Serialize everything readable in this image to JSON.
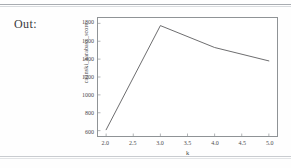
{
  "notebook": {
    "out_label": "Out:"
  },
  "chart_data": {
    "type": "line",
    "title": "",
    "xlabel": "k",
    "ylabel": "calinski_harabasz_score",
    "x": [
      2.0,
      3.0,
      4.0,
      5.0
    ],
    "values": [
      610,
      1775,
      1530,
      1380
    ],
    "series": [
      {
        "name": "calinski_harabasz_score",
        "values": [
          610,
          1775,
          1530,
          1380
        ],
        "color": "#5a5a5c"
      }
    ],
    "xlim": [
      1.85,
      5.15
    ],
    "ylim": [
      540,
      1860
    ],
    "xticks": [
      2.0,
      2.5,
      3.0,
      3.5,
      4.0,
      4.5,
      5.0
    ],
    "xtick_labels": [
      "2.0",
      "2.5",
      "3.0",
      "3.5",
      "4.0",
      "4.5",
      "5.0"
    ],
    "yticks": [
      600,
      800,
      1000,
      1200,
      1400,
      1600,
      1800
    ],
    "ytick_labels": [
      "600",
      "800",
      "1000",
      "1200",
      "1400",
      "1600",
      "1800"
    ],
    "grid": false,
    "legend": false,
    "legend_position": "none",
    "line_color": "#5a5a5c",
    "frame_color": "#8f9396"
  }
}
